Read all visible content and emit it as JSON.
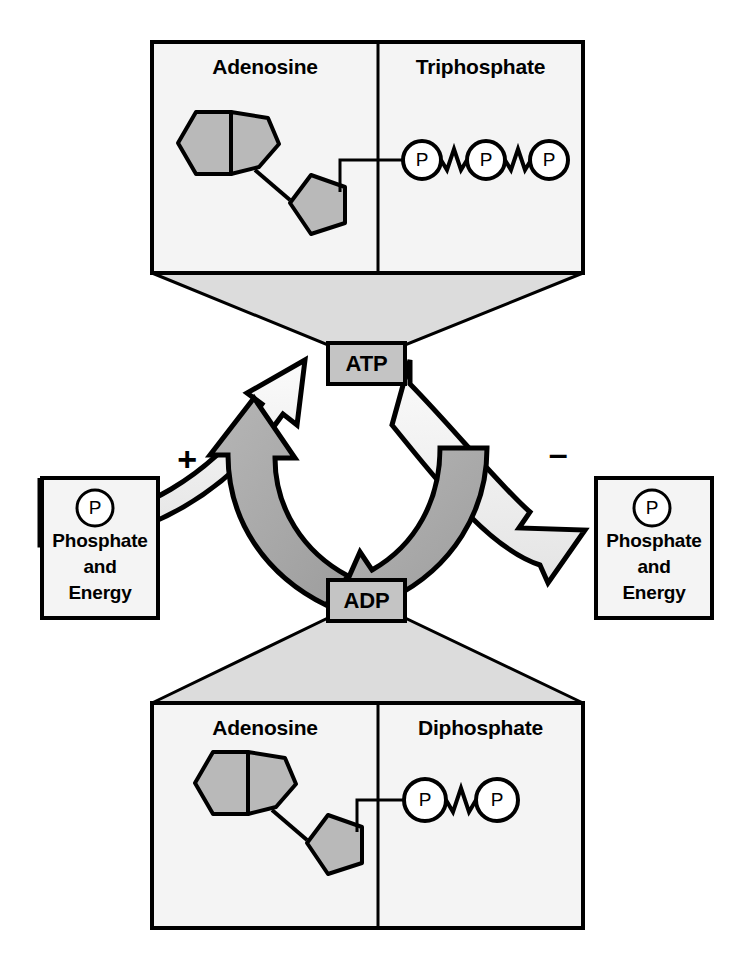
{
  "diagram": {
    "colors": {
      "panel_fill": "#f2f2f2",
      "funnel_fill": "#dcdcdc",
      "ring_fill": "#b3b3b3",
      "node_fill": "#c4c4c4",
      "arrow_light": "#eeeeee",
      "arrow_dark": "#a8a8a8",
      "stroke": "#000000",
      "background": "#ffffff"
    },
    "top_panel": {
      "left_title": "Adenosine",
      "right_title": "Triphosphate",
      "phosphate_count": 3,
      "phosphate_glyph": "P",
      "ring_shapes": [
        "hexagon",
        "pentagon",
        "pentagon"
      ]
    },
    "bottom_panel": {
      "left_title": "Adenosine",
      "right_title": "Diphosphate",
      "phosphate_count": 2,
      "phosphate_glyph": "P",
      "ring_shapes": [
        "hexagon",
        "pentagon",
        "pentagon"
      ]
    },
    "nodes": {
      "top": "ATP",
      "bottom": "ADP"
    },
    "signs": {
      "left": "+",
      "right": "–"
    },
    "left_box": {
      "glyph": "P",
      "line1": "Phosphate",
      "line2": "and",
      "line3": "Energy"
    },
    "right_box": {
      "glyph": "P",
      "line1": "Phosphate",
      "line2": "and",
      "line3": "Energy"
    }
  }
}
